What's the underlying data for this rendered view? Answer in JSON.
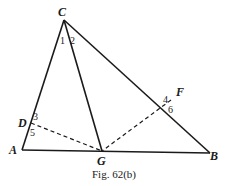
{
  "figure": {
    "caption": "Fig. 62(b)",
    "points": {
      "A": {
        "label": "A",
        "x": 22,
        "y": 150
      },
      "B": {
        "label": "B",
        "x": 210,
        "y": 153
      },
      "C": {
        "label": "C",
        "x": 64,
        "y": 20
      },
      "D": {
        "label": "D",
        "x": 31,
        "y": 123
      },
      "F": {
        "label": "F",
        "x": 171,
        "y": 100
      },
      "G": {
        "label": "G",
        "x": 102,
        "y": 151
      }
    },
    "angle_labels": [
      "1",
      "2",
      "3",
      "4",
      "5",
      "6"
    ],
    "segments_solid": [
      "CA",
      "CB",
      "AB",
      "CG"
    ],
    "segments_dashed": [
      "DG",
      "FG"
    ],
    "colors": {
      "ink": "#1a1a1a",
      "background": "#ffffff"
    }
  }
}
